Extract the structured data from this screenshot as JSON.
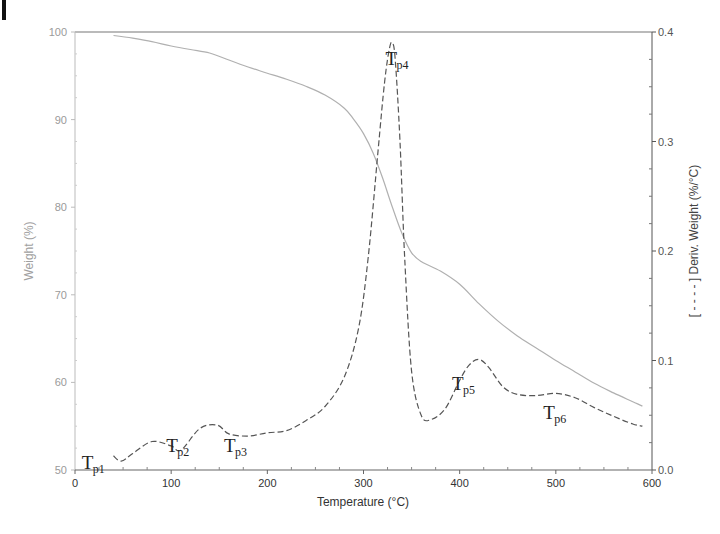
{
  "panel_label": "I",
  "chart_data": {
    "type": "line",
    "title": "",
    "xlabel": "Temperature (°C)",
    "ylabel": "Weight (%)",
    "y2label": "[ - - - - ] Deriv. Weight (%/°C)",
    "xlim": [
      0,
      600
    ],
    "ylim": [
      50,
      100
    ],
    "y2lim": [
      0.0,
      0.4
    ],
    "grid": false,
    "legend": "none",
    "x_ticks": [
      "0",
      "100",
      "200",
      "300",
      "400",
      "500",
      "600"
    ],
    "y_ticks": [
      "50",
      "60",
      "70",
      "80",
      "90",
      "100"
    ],
    "y2_ticks": [
      "0.0",
      "0.1",
      "0.2",
      "0.3",
      "0.4"
    ],
    "series": [
      {
        "name": "Weight (%)",
        "axis": "left",
        "style": "solid",
        "color": "#b0b0b0",
        "x": [
          40,
          60,
          80,
          100,
          120,
          140,
          160,
          180,
          200,
          220,
          240,
          260,
          280,
          290,
          300,
          310,
          320,
          330,
          340,
          350,
          360,
          380,
          400,
          420,
          440,
          460,
          480,
          500,
          520,
          540,
          560,
          580,
          590
        ],
        "values": [
          99.6,
          99.3,
          98.9,
          98.4,
          98.0,
          97.6,
          96.8,
          96.0,
          95.3,
          94.6,
          93.8,
          92.8,
          91.3,
          90.0,
          88.4,
          86.2,
          83.3,
          80.0,
          77.0,
          74.8,
          73.8,
          72.7,
          71.2,
          69.0,
          67.0,
          65.3,
          63.9,
          62.5,
          61.2,
          59.9,
          58.8,
          57.8,
          57.3
        ]
      },
      {
        "name": "Deriv. Weight (%/°C)",
        "axis": "right",
        "style": "dashed",
        "color": "#555555",
        "x": [
          40,
          48,
          60,
          80,
          100,
          110,
          130,
          148,
          160,
          180,
          200,
          220,
          240,
          260,
          280,
          295,
          305,
          315,
          322,
          327,
          330,
          333,
          338,
          343,
          350,
          360,
          370,
          385,
          400,
          410,
          420,
          430,
          445,
          460,
          480,
          500,
          520,
          540,
          560,
          580,
          590
        ],
        "values": [
          0.013,
          0.008,
          0.015,
          0.026,
          0.022,
          0.018,
          0.038,
          0.041,
          0.033,
          0.031,
          0.034,
          0.036,
          0.045,
          0.058,
          0.085,
          0.13,
          0.195,
          0.29,
          0.355,
          0.385,
          0.39,
          0.375,
          0.3,
          0.19,
          0.09,
          0.05,
          0.046,
          0.056,
          0.082,
          0.096,
          0.101,
          0.094,
          0.076,
          0.069,
          0.068,
          0.07,
          0.066,
          0.057,
          0.049,
          0.042,
          0.04
        ]
      }
    ],
    "annotations": [
      {
        "label": "Tp1",
        "main": "T",
        "sub": "p1",
        "x": 7,
        "y": 0.001
      },
      {
        "label": "Tp2",
        "main": "T",
        "sub": "p2",
        "x": 95,
        "y": 0.016
      },
      {
        "label": "Tp3",
        "main": "T",
        "sub": "p3",
        "x": 155,
        "y": 0.016
      },
      {
        "label": "Tp4",
        "main": "T",
        "sub": "p4",
        "x": 323,
        "y": 0.37
      },
      {
        "label": "Tp5",
        "main": "T",
        "sub": "p5",
        "x": 392,
        "y": 0.073
      },
      {
        "label": "Tp6",
        "main": "T",
        "sub": "p6",
        "x": 487,
        "y": 0.047
      }
    ]
  }
}
